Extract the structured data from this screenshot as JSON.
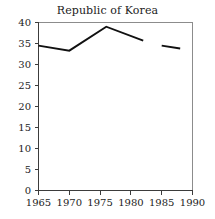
{
  "chart_data": {
    "type": "line",
    "title": "Republic of Korea",
    "xlabel": "",
    "ylabel": "",
    "xlim": [
      1965,
      1990
    ],
    "ylim": [
      0,
      40
    ],
    "xticks": [
      1965,
      1970,
      1975,
      1980,
      1985,
      1990
    ],
    "yticks": [
      0,
      5,
      10,
      15,
      20,
      25,
      30,
      35,
      40
    ],
    "xtick_labels": [
      "1965",
      "1970",
      "1975",
      "1980",
      "1985",
      "1990"
    ],
    "ytick_labels": [
      "0",
      "5",
      "10",
      "15",
      "20",
      "25",
      "30",
      "35",
      "40"
    ],
    "grid": false,
    "legend": null,
    "legend_position": "none",
    "line_color": "#111111",
    "series": [
      {
        "name": "Republic of Korea",
        "segments": [
          {
            "x": [
              1965,
              1970,
              1976,
              1982
            ],
            "y": [
              34.5,
              33.3,
              39.0,
              35.7
            ]
          },
          {
            "x": [
              1985,
              1988
            ],
            "y": [
              34.5,
              33.8
            ]
          }
        ]
      }
    ],
    "note": "series contains a data gap between 1982 and 1985"
  },
  "axis": {
    "title_text": "Republic of Korea"
  }
}
